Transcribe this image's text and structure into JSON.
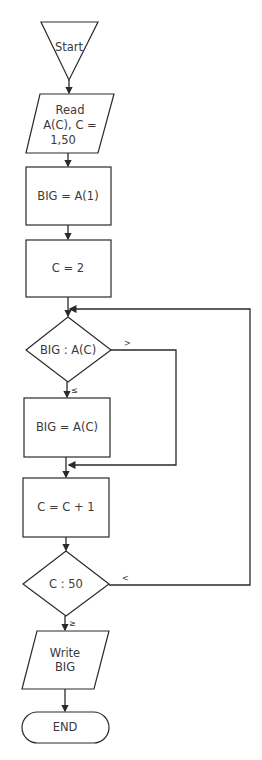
{
  "flowchart": {
    "nodes": {
      "start": {
        "type": "start-triangle",
        "label": "Start"
      },
      "read": {
        "type": "input-parallelogram",
        "lines": [
          "Read",
          "A(C), C =",
          "1,50"
        ]
      },
      "init_big": {
        "type": "process",
        "label": "BIG = A(1)"
      },
      "init_c": {
        "type": "process",
        "label": "C = 2"
      },
      "compare": {
        "type": "decision",
        "label": "BIG : A(C)"
      },
      "assign_big": {
        "type": "process",
        "label": "BIG = A(C)"
      },
      "increment": {
        "type": "process",
        "label": "C = C + 1"
      },
      "check_end": {
        "type": "decision",
        "label": "C : 50"
      },
      "write": {
        "type": "output-parallelogram",
        "lines": [
          "Write",
          "BIG"
        ]
      },
      "end": {
        "type": "terminal",
        "label": "END"
      }
    },
    "branches": {
      "compare_greater": ">",
      "compare_less_equal": "≤",
      "check_less": "<",
      "check_greater_equal": "≥"
    },
    "colors": {
      "stroke": "#2a2a2a",
      "text": "#3a3a3a",
      "background": "#ffffff"
    }
  }
}
